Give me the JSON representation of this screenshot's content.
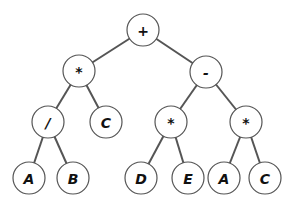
{
  "diagram": {
    "type": "expression-tree",
    "node_radius": 16,
    "colors": {
      "stroke": "#555555",
      "fill": "#ffffff",
      "text": "#111111",
      "background": "#ffffff"
    },
    "nodes": [
      {
        "id": "n0",
        "label": "+",
        "x": 143,
        "y": 30
      },
      {
        "id": "n1",
        "label": "*",
        "x": 79,
        "y": 71
      },
      {
        "id": "n2",
        "label": "-",
        "x": 206,
        "y": 72
      },
      {
        "id": "n3",
        "label": "/",
        "x": 48,
        "y": 122
      },
      {
        "id": "n4",
        "label": "C",
        "x": 106,
        "y": 122
      },
      {
        "id": "n5",
        "label": "*",
        "x": 171,
        "y": 122
      },
      {
        "id": "n6",
        "label": "*",
        "x": 246,
        "y": 122
      },
      {
        "id": "n7",
        "label": "A",
        "x": 29,
        "y": 178
      },
      {
        "id": "n8",
        "label": "B",
        "x": 73,
        "y": 178
      },
      {
        "id": "n9",
        "label": "D",
        "x": 141,
        "y": 178
      },
      {
        "id": "n10",
        "label": "E",
        "x": 188,
        "y": 178
      },
      {
        "id": "n11",
        "label": "A",
        "x": 224,
        "y": 178
      },
      {
        "id": "n12",
        "label": "C",
        "x": 265,
        "y": 178
      }
    ],
    "edges": [
      [
        "n0",
        "n1"
      ],
      [
        "n0",
        "n2"
      ],
      [
        "n1",
        "n3"
      ],
      [
        "n1",
        "n4"
      ],
      [
        "n2",
        "n5"
      ],
      [
        "n2",
        "n6"
      ],
      [
        "n3",
        "n7"
      ],
      [
        "n3",
        "n8"
      ],
      [
        "n5",
        "n9"
      ],
      [
        "n5",
        "n10"
      ],
      [
        "n6",
        "n11"
      ],
      [
        "n6",
        "n12"
      ]
    ]
  }
}
